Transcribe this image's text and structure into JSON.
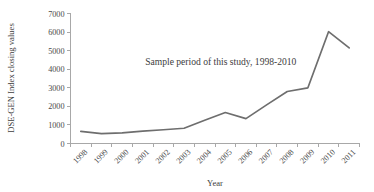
{
  "chart_data": {
    "type": "line",
    "title": "",
    "xlabel": "Year",
    "ylabel": "DSE-GEN Index closing values",
    "categories": [
      "1998",
      "1999",
      "2000",
      "2001",
      "2002",
      "2003",
      "2004",
      "2005",
      "2006",
      "2007",
      "2008",
      "2009",
      "2010",
      "2011"
    ],
    "values": [
      650,
      530,
      570,
      670,
      740,
      820,
      1250,
      1670,
      1340,
      2080,
      2800,
      3000,
      6020,
      5150
    ],
    "series": [
      {
        "name": "DSE-GEN Index closing values",
        "values": [
          650,
          530,
          570,
          670,
          740,
          820,
          1250,
          1670,
          1340,
          2080,
          2800,
          3000,
          6020,
          5150
        ]
      }
    ],
    "ylim": [
      0,
      7000
    ],
    "yticks": [
      0,
      1000,
      2000,
      3000,
      4000,
      5000,
      6000,
      7000
    ],
    "ytick_labels": [
      "0",
      "1000",
      "2000",
      "3000",
      "4000",
      "5000",
      "6000",
      "7000"
    ],
    "xtick_labels": [
      "1998",
      "1999",
      "2000",
      "2001",
      "2002",
      "2003",
      "2004",
      "2005",
      "2006",
      "2007",
      "2008",
      "2009",
      "2010",
      "2011"
    ],
    "grid": false,
    "legend": false,
    "legend_position": "none",
    "annotations": [
      {
        "text": "Sample period of this study, 1998-2010",
        "x_frac": 0.52,
        "y_value": 4250
      }
    ],
    "line_color": "#6e6e6e",
    "axis_color": "#a8a8a8",
    "text_color": "#3d3d3d",
    "background_color": "#ffffff"
  }
}
